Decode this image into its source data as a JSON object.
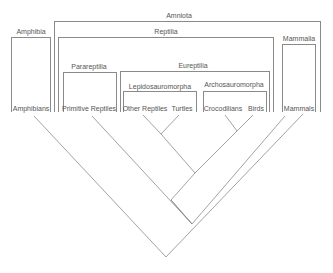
{
  "diagram": {
    "type": "cladogram",
    "groups": {
      "amniota": "Amniota",
      "amphibia": "Amphibia",
      "reptilia": "Reptilia",
      "mammalia": "Mammalia",
      "parareptilia": "Parareptilia",
      "eureptilia": "Eureptilia",
      "lepidosauromorpha": "Lepidosauromorpha",
      "archosauromorpha": "Archosauromorpha"
    },
    "taxa": {
      "amphibians": "Amphibians",
      "primitive_reptiles": "Primitive Reptiles",
      "other_reptiles": "Other Reptiles",
      "turtles": "Turtles",
      "crocodilians": "Crocodilians",
      "birds": "Birds",
      "mammals": "Mammals"
    },
    "line_color": "#8a8a8a"
  }
}
